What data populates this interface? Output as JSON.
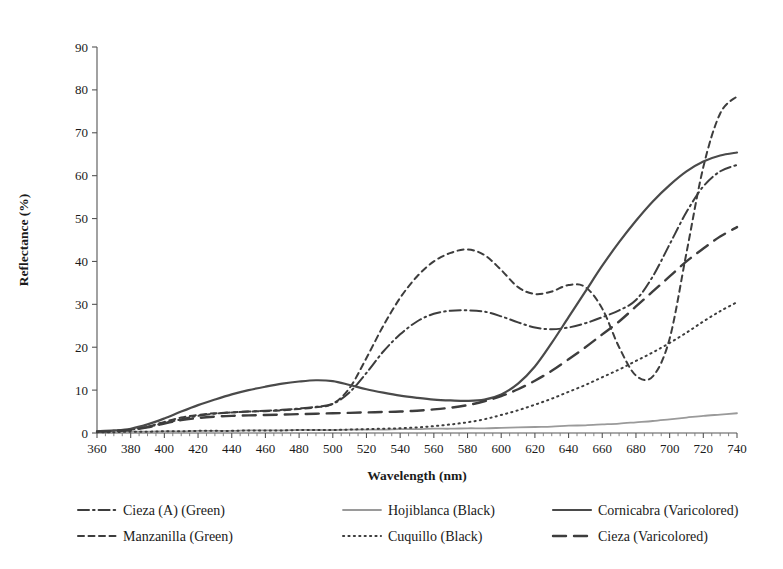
{
  "chart_data": {
    "type": "line",
    "title": "",
    "xlabel": "Wavelength (nm)",
    "ylabel": "Reflectance (%)",
    "xlim": [
      360,
      740
    ],
    "ylim": [
      0,
      90
    ],
    "xticks": [
      360,
      380,
      400,
      420,
      440,
      460,
      480,
      500,
      520,
      540,
      560,
      580,
      600,
      620,
      640,
      660,
      680,
      700,
      720,
      740
    ],
    "yticks": [
      0,
      10,
      20,
      30,
      40,
      50,
      60,
      70,
      80,
      90
    ],
    "xtick_labels": [
      "360",
      "380",
      "400",
      "420",
      "440",
      "460",
      "480",
      "500",
      "520",
      "540",
      "560",
      "580",
      "600",
      "620",
      "640",
      "660",
      "680",
      "700",
      "720",
      "740"
    ],
    "ytick_labels": [
      "0",
      "10",
      "20",
      "30",
      "40",
      "50",
      "60",
      "70",
      "80",
      "90"
    ],
    "grid": false,
    "legend_position": "below-axes",
    "x": [
      360,
      370,
      380,
      390,
      400,
      410,
      420,
      430,
      440,
      450,
      460,
      470,
      480,
      490,
      500,
      510,
      520,
      530,
      540,
      550,
      560,
      570,
      580,
      590,
      600,
      610,
      620,
      630,
      640,
      650,
      660,
      670,
      680,
      690,
      700,
      710,
      720,
      730,
      740
    ],
    "series": [
      {
        "name": "Cieza (A) (Green)",
        "label": "Cieza (A) (Green)",
        "color": "#3d3d3d",
        "dash": "dashdot",
        "width": 2.0,
        "values": [
          0.3,
          0.5,
          0.8,
          1.4,
          2.3,
          3.2,
          4.0,
          4.5,
          4.8,
          5.0,
          5.2,
          5.4,
          5.7,
          6.1,
          6.8,
          9.5,
          14.0,
          19.0,
          23.0,
          26.0,
          27.8,
          28.5,
          28.6,
          28.3,
          27.2,
          25.8,
          24.6,
          24.2,
          24.6,
          25.6,
          27.0,
          28.6,
          31.0,
          36.5,
          44.0,
          51.5,
          57.5,
          61.0,
          62.5
        ]
      },
      {
        "name": "Manzanilla (Green)",
        "label": "Manzanilla (Green)",
        "color": "#3d3d3d",
        "dash": "dashed-short",
        "width": 2.0,
        "values": [
          0.3,
          0.5,
          0.8,
          1.5,
          2.6,
          3.6,
          4.2,
          4.6,
          4.8,
          5.0,
          5.1,
          5.3,
          5.6,
          6.0,
          6.8,
          10.5,
          17.5,
          25.0,
          31.5,
          36.5,
          40.0,
          42.0,
          42.8,
          41.5,
          38.0,
          34.0,
          32.4,
          33.0,
          34.5,
          34.0,
          29.0,
          20.0,
          13.4,
          13.2,
          22.0,
          42.0,
          62.0,
          74.5,
          78.5
        ]
      },
      {
        "name": "Hojiblanca (Black)",
        "label": "Hojiblanca (Black)",
        "color": "#9a9a9a",
        "dash": "solid",
        "width": 1.8,
        "values": [
          0.2,
          0.2,
          0.3,
          0.3,
          0.4,
          0.4,
          0.5,
          0.5,
          0.5,
          0.6,
          0.6,
          0.6,
          0.7,
          0.7,
          0.7,
          0.8,
          0.8,
          0.8,
          0.9,
          0.9,
          1.0,
          1.0,
          1.1,
          1.1,
          1.2,
          1.3,
          1.4,
          1.5,
          1.7,
          1.8,
          2.0,
          2.2,
          2.5,
          2.8,
          3.2,
          3.6,
          4.0,
          4.3,
          4.6
        ]
      },
      {
        "name": "Cuquillo (Black)",
        "label": "Cuquillo (Black)",
        "color": "#3d3d3d",
        "dash": "dotted",
        "width": 2.0,
        "values": [
          0.2,
          0.2,
          0.3,
          0.3,
          0.4,
          0.4,
          0.5,
          0.5,
          0.5,
          0.6,
          0.6,
          0.6,
          0.7,
          0.7,
          0.7,
          0.8,
          0.9,
          1.0,
          1.1,
          1.3,
          1.6,
          2.0,
          2.5,
          3.2,
          4.2,
          5.3,
          6.6,
          8.0,
          9.6,
          11.2,
          13.0,
          14.8,
          16.8,
          18.8,
          21.0,
          23.4,
          26.0,
          28.4,
          30.5
        ]
      },
      {
        "name": "Cornicabra (Varicolored)",
        "label": "Cornicabra (Varicolored)",
        "color": "#4a4a4a",
        "dash": "solid",
        "width": 2.2,
        "values": [
          0.4,
          0.6,
          1.0,
          2.0,
          3.4,
          5.0,
          6.5,
          7.8,
          9.0,
          10.0,
          10.8,
          11.5,
          12.0,
          12.3,
          12.1,
          11.2,
          10.2,
          9.4,
          8.7,
          8.2,
          7.8,
          7.6,
          7.5,
          7.8,
          9.0,
          11.5,
          15.5,
          21.0,
          27.0,
          33.0,
          39.0,
          44.5,
          49.5,
          54.0,
          57.8,
          61.0,
          63.3,
          64.7,
          65.4
        ]
      },
      {
        "name": "Cieza (Varicolored)",
        "label": "Cieza (Varicolored)",
        "color": "#3d3d3d",
        "dash": "dashed-long",
        "width": 2.4,
        "values": [
          0.3,
          0.4,
          0.7,
          1.3,
          2.2,
          3.0,
          3.5,
          3.8,
          4.0,
          4.1,
          4.2,
          4.3,
          4.4,
          4.5,
          4.6,
          4.7,
          4.8,
          4.9,
          5.0,
          5.2,
          5.5,
          5.9,
          6.5,
          7.4,
          8.6,
          10.2,
          12.2,
          14.5,
          17.2,
          20.0,
          23.0,
          26.0,
          29.5,
          33.0,
          36.5,
          40.0,
          43.0,
          45.8,
          48.0
        ]
      }
    ],
    "legend_layout": [
      [
        "Cieza (A) (Green)",
        "Hojiblanca (Black)",
        "Cornicabra (Varicolored)"
      ],
      [
        "Manzanilla (Green)",
        "Cuquillo (Black)",
        "Cieza (Varicolored)"
      ]
    ]
  }
}
